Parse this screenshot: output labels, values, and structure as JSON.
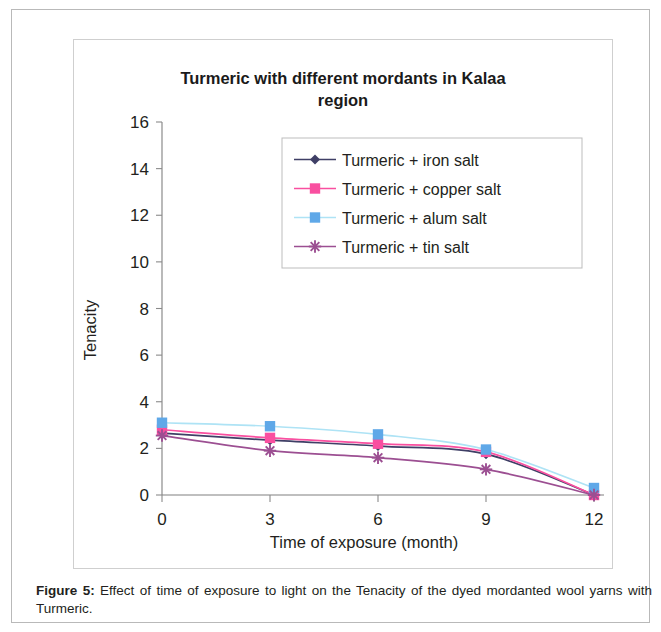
{
  "figure": {
    "caption_label": "Figure 5:",
    "caption_text": " Effect of time of exposure to light on the Tenacity of the dyed mordanted wool yarns with Turmeric."
  },
  "chart_data": {
    "type": "line",
    "title": "Turmeric with different mordants in Kalaa region",
    "title_line1": "Turmeric with different mordants in Kalaa",
    "title_line2": "region",
    "xlabel": "Time of exposure (month)",
    "ylabel": "Tenacity",
    "x": [
      0,
      3,
      6,
      9,
      12
    ],
    "xticklabels": [
      "0",
      "3",
      "6",
      "9",
      "12"
    ],
    "xlim": [
      0,
      12
    ],
    "ylim": [
      0,
      16
    ],
    "yticks": [
      0,
      2,
      4,
      6,
      8,
      10,
      12,
      14,
      16
    ],
    "yticklabels": [
      "0",
      "2",
      "4",
      "6",
      "8",
      "10",
      "12",
      "14",
      "16"
    ],
    "grid": false,
    "legend_position": "upper right",
    "series": [
      {
        "name": "Turmeric + iron salt",
        "color": "#3f3f66",
        "marker": "diamond",
        "values": [
          2.65,
          2.35,
          2.1,
          1.75,
          0.0
        ]
      },
      {
        "name": "Turmeric + copper salt",
        "color": "#f94fa0",
        "marker": "square",
        "values": [
          2.8,
          2.45,
          2.2,
          1.85,
          0.0
        ]
      },
      {
        "name": "Turmeric + alum salt",
        "color": "#aee3f5",
        "marker": "square",
        "marker_color": "#5fa8e8",
        "values": [
          3.1,
          2.95,
          2.6,
          1.95,
          0.3
        ]
      },
      {
        "name": "Turmeric + tin salt",
        "color": "#9c4f92",
        "marker": "asterisk",
        "values": [
          2.55,
          1.9,
          1.6,
          1.1,
          0.0
        ]
      }
    ]
  }
}
